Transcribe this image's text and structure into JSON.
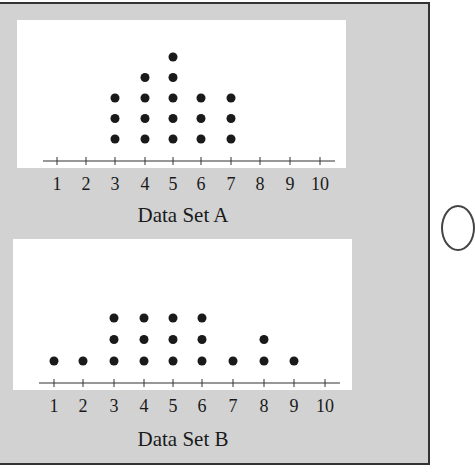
{
  "chart_data": [
    {
      "type": "dot",
      "title": "Data Set A",
      "xlabel": "Data Set A",
      "x_ticks": [
        1,
        2,
        3,
        4,
        5,
        6,
        7,
        8,
        9,
        10
      ],
      "categories": [
        1,
        2,
        3,
        4,
        5,
        6,
        7,
        8,
        9,
        10
      ],
      "values": [
        0,
        0,
        3,
        4,
        5,
        3,
        3,
        0,
        0,
        0
      ],
      "xlim": [
        1,
        10
      ]
    },
    {
      "type": "dot",
      "title": "Data Set B",
      "xlabel": "Data Set B",
      "x_ticks": [
        1,
        2,
        3,
        4,
        5,
        6,
        7,
        8,
        9,
        10
      ],
      "categories": [
        1,
        2,
        3,
        4,
        5,
        6,
        7,
        8,
        9,
        10
      ],
      "values": [
        1,
        1,
        3,
        3,
        3,
        3,
        1,
        2,
        1,
        0
      ],
      "xlim": [
        1,
        10
      ]
    }
  ],
  "labels": {
    "a": "Data Set A",
    "b": "Data Set B"
  },
  "colors": {
    "frame": "#d2d2d2",
    "panel": "#ffffff",
    "dot": "#1a1a1a"
  }
}
